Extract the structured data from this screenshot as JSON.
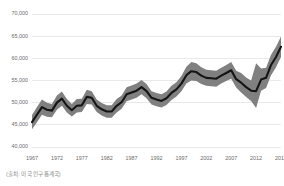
{
  "source_note": "(출처: 미국 인구통계국)",
  "chart_data": {
    "type": "line",
    "title": "",
    "subtitle": "",
    "xlabel": "",
    "ylabel": "",
    "grid": true,
    "legend": null,
    "xlim": [
      1967,
      2017
    ],
    "ylim": [
      40000,
      70000
    ],
    "ytick_labels": [
      "70,000",
      "65,000",
      "60,000",
      "55,000",
      "50,000",
      "45,000",
      "40,000"
    ],
    "ytick_values": [
      70000,
      65000,
      60000,
      55000,
      50000,
      45000,
      40000
    ],
    "xtick_labels": [
      "1967",
      "1972",
      "1977",
      "1982",
      "1987",
      "1992",
      "1997",
      "2002",
      "2007",
      "2012",
      "2017"
    ],
    "xtick_values": [
      1967,
      1972,
      1977,
      1982,
      1987,
      1992,
      1997,
      2002,
      2007,
      2012,
      2017
    ],
    "line_color": "#141414",
    "band_color": "#808080",
    "grid_color": "#e3e3e3",
    "axis_text_color": "#6b6b6b",
    "x": [
      1967,
      1968,
      1969,
      1970,
      1971,
      1972,
      1973,
      1974,
      1975,
      1976,
      1977,
      1978,
      1979,
      1980,
      1981,
      1982,
      1983,
      1984,
      1985,
      1986,
      1987,
      1988,
      1989,
      1990,
      1991,
      1992,
      1993,
      1994,
      1995,
      1996,
      1997,
      1998,
      1999,
      2000,
      2001,
      2002,
      2003,
      2004,
      2005,
      2006,
      2007,
      2008,
      2009,
      2010,
      2011,
      2012,
      2013,
      2014,
      2015,
      2016,
      2017
    ],
    "series": [
      {
        "name": "Median household income",
        "values": [
          45600,
          47300,
          49000,
          48400,
          48200,
          50000,
          50900,
          49300,
          48300,
          49300,
          49400,
          51300,
          51100,
          49300,
          48500,
          48000,
          48000,
          49300,
          50100,
          51900,
          52300,
          52700,
          53500,
          52600,
          51100,
          50700,
          50400,
          51000,
          52200,
          53000,
          54300,
          56200,
          57100,
          56900,
          56100,
          55600,
          55500,
          55400,
          56100,
          56700,
          57300,
          55300,
          54500,
          53500,
          52700,
          52600,
          55200,
          55600,
          58500,
          60300,
          62600
        ],
        "band_lower": [
          44000,
          45600,
          47300,
          46800,
          46700,
          48400,
          49300,
          47800,
          46900,
          47800,
          47900,
          49700,
          49600,
          47900,
          47100,
          46600,
          46600,
          47800,
          48600,
          50300,
          50700,
          51100,
          51900,
          51000,
          49600,
          49200,
          48900,
          49500,
          50600,
          51400,
          52600,
          54300,
          55000,
          54900,
          54200,
          53800,
          53700,
          53600,
          54300,
          54900,
          55400,
          53400,
          52300,
          51300,
          50400,
          48800,
          52700,
          53300,
          56200,
          58000,
          60300
        ],
        "band_upper": [
          47200,
          49000,
          50700,
          50000,
          49700,
          51600,
          52500,
          50800,
          49700,
          50800,
          50900,
          52900,
          52600,
          50700,
          49900,
          49400,
          49400,
          50800,
          51600,
          53500,
          53900,
          54300,
          55100,
          54200,
          52600,
          52200,
          51900,
          52500,
          53800,
          54600,
          56000,
          58100,
          59200,
          58900,
          58000,
          57400,
          57300,
          57200,
          57900,
          58500,
          59200,
          57200,
          56700,
          55700,
          55000,
          58900,
          57700,
          57900,
          60800,
          62600,
          64900
        ]
      }
    ]
  }
}
